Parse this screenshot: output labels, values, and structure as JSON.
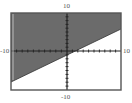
{
  "chart_data": {
    "type": "area",
    "title": "",
    "xlabel": "",
    "ylabel": "",
    "xlim": [
      -10,
      10
    ],
    "ylim": [
      -10,
      10
    ],
    "x_tick_labels": {
      "min": "-10",
      "max": "10"
    },
    "y_tick_labels": {
      "min": "-10",
      "max": "10"
    },
    "ticks_per_side": 10,
    "grid": false,
    "legend": null,
    "boundary_line": {
      "style": "solid",
      "points": [
        {
          "x": -10,
          "y": -8.0
        },
        {
          "x": 10,
          "y": 5.7
        }
      ],
      "approx_slope": 0.69,
      "approx_intercept": -1.1
    },
    "shaded_region": "above",
    "inequality_direction": "y >= line"
  },
  "labels": {
    "y_max": "10",
    "y_min": "-10",
    "x_min": "-10",
    "x_max": "10"
  },
  "colors": {
    "shade": "#6b6b6b",
    "frame": "#555555",
    "axes": "#222222",
    "background": "#ffffff"
  },
  "layout_px": {
    "frame": {
      "left": 11,
      "top": 13,
      "right": 121,
      "bottom": 90
    },
    "origin": {
      "x": 67,
      "y": 51
    },
    "line_left_y": 82,
    "line_right_y": 29
  }
}
